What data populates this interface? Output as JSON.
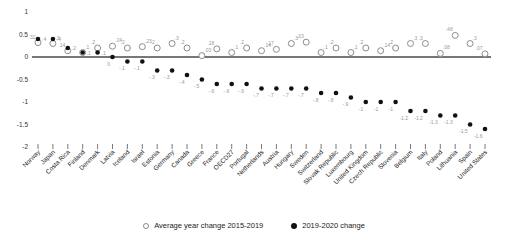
{
  "chart_data": {
    "type": "scatter",
    "title": "",
    "xlabel": "",
    "ylabel": "",
    "categories": [
      "Norway",
      "Japan",
      "Costa Rica",
      "Finland",
      "Denmark",
      "Latvia",
      "Iceland",
      "Israel",
      "Estonia",
      "Germany",
      "Canada",
      "Greece",
      "France",
      "OECD27",
      "Portugal",
      "Netherlands",
      "Austria",
      "Hungary",
      "Sweden",
      "Switzerland",
      "Slovak Republic",
      "Luxembourg",
      "United Kingdom",
      "Czech Republic",
      "Slovenia",
      "Belgium",
      "Italy",
      "Poland",
      "Lithuania",
      "Spain",
      "United States"
    ],
    "series": [
      {
        "name": "Average year change 2015-2019",
        "marker": "open-circle",
        "color": "#8c8c8c",
        "values": [
          0.32,
          0.3,
          0.14,
          0.1,
          0.2,
          0.24,
          0.2,
          0.23,
          0.2,
          0.3,
          0.2,
          0.03,
          0.18,
          0.1,
          0.2,
          0.14,
          0.17,
          0.3,
          0.33,
          0.1,
          0.2,
          0.1,
          0.2,
          0.14,
          0.2,
          0.3,
          0.3,
          0.08,
          0.48,
          0.3,
          0.07
        ],
        "labels": [
          ".32",
          ".3",
          ".14",
          ".1",
          ".2",
          ".24",
          ".2",
          ".23",
          ".2",
          ".3",
          ".2",
          ".03",
          ".18",
          ".1",
          ".2",
          ".14",
          ".17",
          ".3",
          ".33",
          ".1",
          ".2",
          ".1",
          ".2",
          ".14",
          ".2",
          ".3",
          ".3",
          ".08",
          ".48",
          ".3",
          ".07"
        ]
      },
      {
        "name": "2019-2020 change",
        "marker": "filled-circle",
        "color": "#111111",
        "values": [
          0.4,
          0.4,
          0.2,
          0.1,
          0.1,
          0,
          -0.1,
          -0.1,
          -0.3,
          -0.3,
          -0.4,
          -0.5,
          -0.6,
          -0.6,
          -0.6,
          -0.7,
          -0.7,
          -0.7,
          -0.7,
          -0.8,
          -0.8,
          -0.9,
          -1,
          -1,
          -1,
          -1.2,
          -1.2,
          -1.3,
          -1.3,
          -1.5,
          -1.6
        ],
        "labels": [
          ".4",
          ".4",
          ".2",
          ".1",
          ".1",
          "0",
          "-.1",
          "-.1",
          "-.3",
          "-.3",
          "-.4",
          "-.5",
          "-.6",
          "-.6",
          "-.6",
          "-.7",
          "-.7",
          "-.7",
          "-.7",
          "-.8",
          "-.8",
          "-.9",
          "-1",
          "-1",
          "-1",
          "-1.2",
          "-1.2",
          "-1.3",
          "-1.3",
          "-1.5",
          "-1.6"
        ]
      }
    ],
    "ylim": [
      -2,
      1
    ],
    "yticks": [
      1,
      0.5,
      0,
      -0.5,
      -1,
      -1.5,
      -2
    ],
    "ytick_labels": [
      "1",
      "0.5",
      "0",
      "-0.5",
      "-1",
      "-1.5",
      "-2"
    ],
    "grid": false,
    "zero_line": true,
    "legend_position": "bottom-center",
    "colors": {
      "axis_line": "#4a4a4a",
      "tick_text": "#333333",
      "category_text": "#222222",
      "value_label": "#999999",
      "open_marker_stroke": "#8c8c8c",
      "filled_marker_fill": "#111111"
    }
  }
}
